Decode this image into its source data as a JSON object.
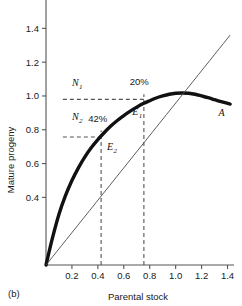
{
  "figure": {
    "panel_label": "(b)",
    "xlabel": "Parental stock",
    "ylabel": "Mature progeny"
  },
  "chart_data": {
    "type": "line",
    "title": "",
    "xlabel": "Parental stock",
    "ylabel": "Mature progeny",
    "xlim": [
      0,
      1.45
    ],
    "ylim": [
      0,
      1.55
    ],
    "xticks": [
      0.2,
      0.4,
      0.6,
      0.8,
      1.0,
      1.2,
      1.4
    ],
    "xtick_labels": [
      "0.2",
      "0.4",
      "0.6",
      "0.8",
      "1.0",
      "1.2",
      "1.4"
    ],
    "yticks": [
      0.4,
      0.6,
      0.8,
      1.0,
      1.2,
      1.4
    ],
    "ytick_labels": [
      "0.4",
      "0.6",
      "0.8",
      "1.0",
      "1.2",
      "1.4"
    ],
    "grid": false,
    "legend": "none",
    "series": [
      {
        "name": "A",
        "style": "thick-solid",
        "label": "A",
        "label_x": 1.33,
        "label_y": 0.88,
        "points": [
          [
            0.0,
            0.0
          ],
          [
            0.05,
            0.16
          ],
          [
            0.1,
            0.3
          ],
          [
            0.15,
            0.41
          ],
          [
            0.2,
            0.5
          ],
          [
            0.25,
            0.575
          ],
          [
            0.3,
            0.64
          ],
          [
            0.35,
            0.695
          ],
          [
            0.4,
            0.742
          ],
          [
            0.45,
            0.784
          ],
          [
            0.5,
            0.822
          ],
          [
            0.55,
            0.855
          ],
          [
            0.6,
            0.884
          ],
          [
            0.65,
            0.91
          ],
          [
            0.7,
            0.934
          ],
          [
            0.75,
            0.955
          ],
          [
            0.8,
            0.972
          ],
          [
            0.85,
            0.988
          ],
          [
            0.9,
            1.0
          ],
          [
            0.95,
            1.01
          ],
          [
            1.0,
            1.016
          ],
          [
            1.05,
            1.018
          ],
          [
            1.1,
            1.016
          ],
          [
            1.15,
            1.01
          ],
          [
            1.2,
            1.0
          ],
          [
            1.25,
            0.99
          ],
          [
            1.3,
            0.978
          ],
          [
            1.35,
            0.966
          ],
          [
            1.42,
            0.952
          ]
        ]
      },
      {
        "name": "replacement-line",
        "style": "thin-solid",
        "points": [
          [
            0.0,
            0.0
          ],
          [
            1.42,
            1.36
          ]
        ]
      }
    ],
    "annotations": [
      {
        "name": "N1",
        "text": "N",
        "subscript": "1",
        "x": 0.2,
        "y": 1.06,
        "level_y": 0.98
      },
      {
        "name": "N2",
        "text": "N",
        "subscript": "2",
        "x": 0.2,
        "y": 0.855,
        "level_y": 0.757
      },
      {
        "name": "E1",
        "text": "E",
        "subscript": "1",
        "x": 0.665,
        "y": 0.885
      },
      {
        "name": "E2",
        "text": "E",
        "subscript": "2",
        "x": 0.47,
        "y": 0.678
      },
      {
        "name": "pct-20",
        "text": "20%",
        "x": 0.645,
        "y": 1.065
      },
      {
        "name": "pct-42",
        "text": "42%",
        "x": 0.325,
        "y": 0.845
      },
      {
        "name": "curve-label-A",
        "text": "A",
        "x": 1.33,
        "y": 0.88
      }
    ],
    "guides": [
      {
        "name": "N1-horizontal",
        "type": "dashed-horizontal",
        "y": 0.98,
        "x_from": 0.13,
        "x_to": 0.755
      },
      {
        "name": "N2-horizontal",
        "type": "dashed-horizontal",
        "y": 0.757,
        "x_from": 0.13,
        "x_to": 0.425
      },
      {
        "name": "E1-vertical",
        "type": "dashed-vertical",
        "x": 0.755,
        "y_from": 0.0,
        "y_to": 1.01
      },
      {
        "name": "E2-vertical",
        "type": "dashed-vertical",
        "x": 0.425,
        "y_from": 0.0,
        "y_to": 0.795
      }
    ]
  }
}
